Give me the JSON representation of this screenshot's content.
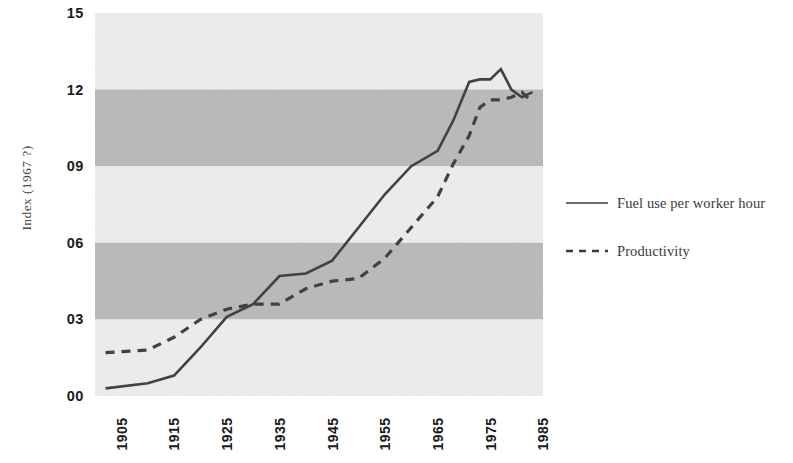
{
  "chart_data": {
    "type": "line",
    "title": "",
    "subtitle": "",
    "xlabel": "",
    "ylabel": "Index (1967 ?)",
    "xlim": [
      1900,
      1985
    ],
    "ylim": [
      0,
      15
    ],
    "grid": false,
    "banded_background": true,
    "band_colors": {
      "light": "#ededed",
      "dark": "#b9b9b9"
    },
    "bands": [
      {
        "from": 12,
        "to": 15,
        "shade": "light"
      },
      {
        "from": 9,
        "to": 12,
        "shade": "dark"
      },
      {
        "from": 6,
        "to": 9,
        "shade": "light"
      },
      {
        "from": 3,
        "to": 6,
        "shade": "dark"
      },
      {
        "from": 0,
        "to": 3,
        "shade": "light"
      }
    ],
    "ytick_labels": [
      "15",
      "12",
      "09",
      "06",
      "03",
      "00"
    ],
    "ytick_values": [
      15,
      12,
      9,
      6,
      3,
      0
    ],
    "xtick_labels": [
      "1905",
      "1915",
      "1925",
      "1935",
      "1945",
      "1955",
      "1965",
      "1975",
      "1985"
    ],
    "xtick_values": [
      1905,
      1915,
      1925,
      1935,
      1945,
      1955,
      1965,
      1975,
      1985
    ],
    "legend_position": "right",
    "series": [
      {
        "name": "Fuel use per worker hour",
        "style": "solid",
        "color": "#3c3c3c",
        "x": [
          1902,
          1910,
          1915,
          1920,
          1925,
          1930,
          1935,
          1940,
          1945,
          1950,
          1955,
          1960,
          1965,
          1968,
          1971,
          1973,
          1975,
          1977,
          1979,
          1981,
          1983
        ],
        "y": [
          0.3,
          0.5,
          0.8,
          1.9,
          3.1,
          3.6,
          4.7,
          4.8,
          5.3,
          6.6,
          7.9,
          9.0,
          9.6,
          10.8,
          12.3,
          12.4,
          12.4,
          12.8,
          12.0,
          11.7,
          11.9
        ]
      },
      {
        "name": "Productivity",
        "style": "dashed",
        "color": "#3c3c3c",
        "x": [
          1902,
          1910,
          1915,
          1920,
          1925,
          1930,
          1935,
          1940,
          1945,
          1950,
          1955,
          1960,
          1965,
          1968,
          1971,
          1973,
          1975,
          1977,
          1979,
          1981,
          1983
        ],
        "y": [
          1.7,
          1.8,
          2.3,
          3.0,
          3.4,
          3.6,
          3.6,
          4.2,
          4.5,
          4.6,
          5.4,
          6.6,
          7.8,
          9.1,
          10.2,
          11.3,
          11.6,
          11.6,
          11.7,
          11.9,
          11.5
        ]
      }
    ]
  },
  "axes": {
    "y_title": "Index (1967 ?)"
  },
  "legend": {
    "items": [
      {
        "label": "Fuel use per worker hour",
        "style": "solid"
      },
      {
        "label": "Productivity",
        "style": "dashed"
      }
    ]
  }
}
